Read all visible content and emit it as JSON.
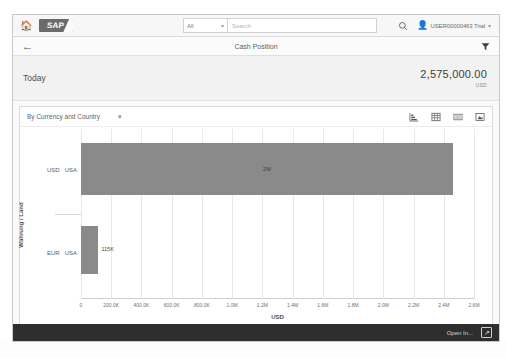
{
  "shellbar": {
    "home_icon": "home-icon",
    "logo_text": "SAP",
    "search_scope_value": "All",
    "search_placeholder": "Search",
    "search_value": "",
    "search_icon": "search-icon",
    "user_icon": "user-avatar-icon",
    "user_name": "USER00000463 Trial"
  },
  "page_header": {
    "back_icon": "back-arrow-icon",
    "title": "Cash Position",
    "filter_icon": "filter-icon"
  },
  "kpi": {
    "period_label": "Today",
    "value": "2,575,000.00",
    "unit": "USD"
  },
  "chart_toolbar": {
    "dimension_label": "By Currency and Country",
    "chevron": "∨",
    "icons": [
      {
        "name": "chart-view-icon",
        "glyph": "◥"
      },
      {
        "name": "table-view-icon",
        "glyph": "⌸"
      },
      {
        "name": "list-view-icon",
        "glyph": "☰"
      },
      {
        "name": "fullscreen-icon",
        "glyph": "⛶"
      }
    ]
  },
  "chart_data": {
    "type": "bar",
    "orientation": "horizontal",
    "title": "",
    "xlabel": "USD",
    "ylabel": "Währung / Land",
    "categories": [
      "USD   USA",
      "EUR   USA"
    ],
    "category_parts": [
      {
        "currency": "USD",
        "country": "USA"
      },
      {
        "currency": "EUR",
        "country": "USA"
      }
    ],
    "values": [
      2460000,
      115000
    ],
    "value_labels": [
      "2M",
      "115K"
    ],
    "xlim": [
      0,
      2600000
    ],
    "xticks": [
      0,
      200000,
      400000,
      600000,
      800000,
      1000000,
      1200000,
      1400000,
      1600000,
      1800000,
      2000000,
      2200000,
      2400000,
      2600000
    ],
    "xtick_labels": [
      "0",
      "200.0K",
      "400.0K",
      "600.0K",
      "800.0K",
      "1.0M",
      "1.2M",
      "1.4M",
      "1.6M",
      "1.8M",
      "2.0M",
      "2.2M",
      "2.4M",
      "2.6M"
    ],
    "grid": true,
    "legend": false,
    "bar_color": "#8a8a8a"
  },
  "footer": {
    "action_label": "Open In...",
    "share_icon": "share-icon"
  },
  "caption": {
    "text": ""
  },
  "colors": {
    "bar": "#8a8a8a",
    "shell_bg": "#f7f7f7",
    "kpi_bg": "#f2f2f2",
    "footer_bg": "#2e2e2e",
    "grid": "#e8e8e8"
  }
}
